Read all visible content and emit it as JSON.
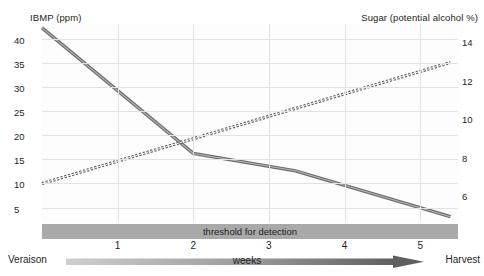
{
  "chart_data": {
    "type": "line",
    "title": "",
    "xlabel": "weeks",
    "x_axis": {
      "start_label": "Veraison",
      "end_label": "Harvest",
      "tick_labels": [
        "1",
        "2",
        "3",
        "4",
        "5"
      ],
      "tick_values": [
        1,
        2,
        3,
        4,
        5
      ],
      "range": [
        0,
        5.5
      ],
      "arrow_label": "weeks"
    },
    "y_axis_left": {
      "label": "IBMP (ppm)",
      "tick_labels": [
        "40",
        "35",
        "30",
        "25",
        "20",
        "15",
        "10",
        "5"
      ],
      "tick_values": [
        40,
        35,
        30,
        25,
        20,
        15,
        10,
        5
      ],
      "range": [
        2,
        43
      ]
    },
    "y_axis_right": {
      "label": "Sugar (potential alcohol %)",
      "tick_labels": [
        "14",
        "12",
        "10",
        "8",
        "6"
      ],
      "tick_values": [
        14,
        12,
        10,
        8,
        6
      ],
      "range": [
        4.6,
        14.9
      ]
    },
    "grid": true,
    "legend_position": "none",
    "series": [
      {
        "name": "IBMP (ppm)",
        "axis": "left",
        "style": "solid",
        "color": "#6e6e6e",
        "x": [
          0,
          2,
          3.35,
          5.4
        ],
        "values": [
          42.2,
          16.2,
          12.6,
          3.1
        ]
      },
      {
        "name": "Sugar (potential alcohol %)",
        "axis": "right",
        "style": "dashed",
        "color": "#6e6e6e",
        "x": [
          0,
          5.4
        ],
        "values": [
          6.6,
          12.9
        ]
      }
    ],
    "annotations": [
      {
        "name": "threshold-for-detection",
        "text": "threshold for detection",
        "type": "band",
        "color": "#a9a9a9"
      }
    ]
  },
  "axes": {
    "left_title": "IBMP (ppm)",
    "right_title": "Sugar (potential alcohol %)",
    "left_ticks": [
      {
        "label": "40",
        "value": 40
      },
      {
        "label": "35",
        "value": 35
      },
      {
        "label": "30",
        "value": 30
      },
      {
        "label": "25",
        "value": 25
      },
      {
        "label": "20",
        "value": 20
      },
      {
        "label": "15",
        "value": 15
      },
      {
        "label": "10",
        "value": 10
      },
      {
        "label": "5",
        "value": 5
      }
    ],
    "right_ticks": [
      {
        "label": "14",
        "value": 14
      },
      {
        "label": "12",
        "value": 12
      },
      {
        "label": "10",
        "value": 10
      },
      {
        "label": "8",
        "value": 8
      },
      {
        "label": "6",
        "value": 6
      }
    ],
    "week_ticks": [
      {
        "label": "1",
        "value": 1
      },
      {
        "label": "2",
        "value": 2
      },
      {
        "label": "3",
        "value": 3
      },
      {
        "label": "4",
        "value": 4
      },
      {
        "label": "5",
        "value": 5
      }
    ]
  },
  "labels": {
    "threshold": "threshold for detection",
    "veraison": "Veraison",
    "harvest": "Harvest",
    "weeks": "weeks"
  },
  "colors": {
    "line": "#6e6e6e",
    "line_dark": "#4a4a4a",
    "grid": "#e2e2e2",
    "band": "#a9a9a9",
    "arrow_light": "#c9c9c9",
    "arrow_dark": "#666666",
    "text": "#231f20",
    "plot_bg": "#fdfdfd"
  }
}
